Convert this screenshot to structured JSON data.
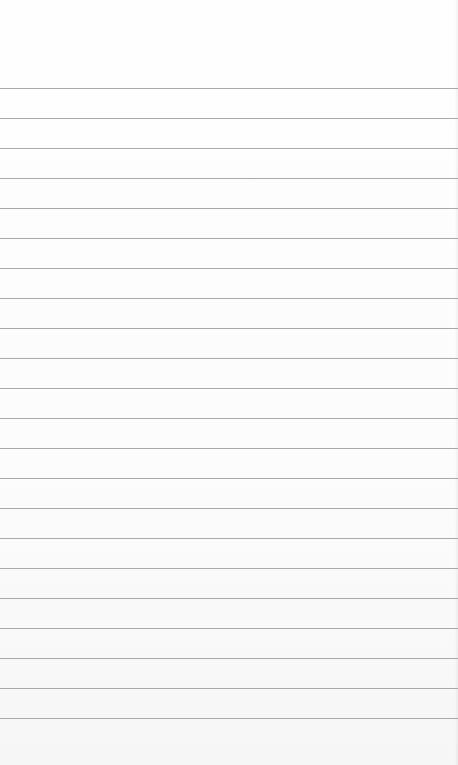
{
  "page": {
    "type": "ruled-sheet",
    "rule_color": "#9a9a9a",
    "background_color": "#fdfdfd",
    "rules": {
      "count": 22,
      "first_y": 88,
      "spacing": 30
    },
    "content_text": ""
  }
}
